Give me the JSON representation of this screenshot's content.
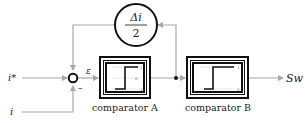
{
  "diagram": {
    "inputs": [
      {
        "id": "ref",
        "label": "i*"
      },
      {
        "id": "meas",
        "label": "i"
      }
    ],
    "summing_junction": {
      "plus_sign": "",
      "minus_sign": "–"
    },
    "error_label": "ε",
    "gain_block": {
      "numerator": "Δi",
      "denominator": "2"
    },
    "comparator_a": {
      "label": "comparator A",
      "levels": {
        "high": "1",
        "mid": "0",
        "low": "-1"
      }
    },
    "comparator_b": {
      "label": "comparator B",
      "levels": {
        "high": "1",
        "low": "0"
      }
    },
    "output_label": "Sw",
    "colors": {
      "wire": "#a8a8a8",
      "block": "#111111",
      "text": "#222222"
    }
  }
}
